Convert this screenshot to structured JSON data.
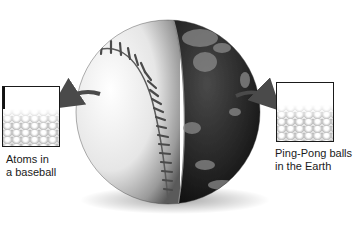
{
  "figure": {
    "left_inset": {
      "caption_line1": "Atoms in",
      "caption_line2": "a baseball",
      "icon": "arrow-left-icon"
    },
    "right_inset": {
      "caption_line1": "Ping-Pong balls",
      "caption_line2": "in the Earth",
      "icon": "arrow-right-icon"
    },
    "colors": {
      "baseball": "#e8e8e8",
      "earth": "#2a2a2a",
      "stitch": "#555555",
      "arrow": "#4a4a4a",
      "text": "#1a1a1a"
    }
  }
}
